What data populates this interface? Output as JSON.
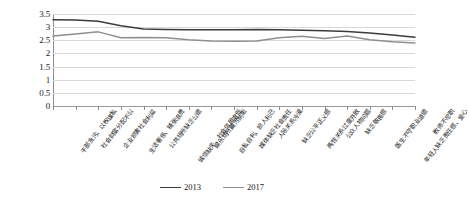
{
  "chart_data": {
    "type": "line",
    "title": "",
    "xlabel": "",
    "ylabel": "",
    "ylim": [
      0,
      3.5
    ],
    "ytick_labels": [
      "3.5",
      "3",
      "2.5",
      "2",
      "1.5",
      "1",
      "0.5",
      "0"
    ],
    "ytick_values": [
      3.5,
      3,
      2.5,
      2,
      1.5,
      1,
      0.5,
      0
    ],
    "grid": true,
    "legend_position": "bottom-center",
    "categories": [
      "干部贪污，以权谋私",
      "社会财富分配不公",
      "企业损害社会利益",
      "生活奢侈、铺张浪费",
      "公共场所缺乏公德",
      "诚信缺失、社会信用度低",
      "娱乐场所藏污纳垢",
      "自私自利、损人利己",
      "媒体缺乏社会责任",
      "人际关系冷漠",
      "缺乏公平正义感",
      "两性关系过度开放",
      "公众人物问题",
      "缺乏敬畏感",
      "医生不守职业道德",
      "年轻人缺乏责任感、爱心",
      "教师不尽职"
    ],
    "series": [
      {
        "name": "2013",
        "color": "#3b3b3b",
        "values": [
          3.28,
          3.27,
          3.22,
          3.05,
          2.93,
          2.91,
          2.9,
          2.9,
          2.9,
          2.91,
          2.9,
          2.88,
          2.86,
          2.83,
          2.78,
          2.7,
          2.62
        ]
      },
      {
        "name": "2017",
        "color": "#8f8f8f",
        "values": [
          2.66,
          2.74,
          2.82,
          2.6,
          2.61,
          2.6,
          2.52,
          2.47,
          2.46,
          2.47,
          2.6,
          2.65,
          2.57,
          2.66,
          2.52,
          2.44,
          2.4
        ]
      }
    ],
    "legend": [
      {
        "label": "2013",
        "color": "#3b3b3b"
      },
      {
        "label": "2017",
        "color": "#8f8f8f"
      }
    ]
  }
}
